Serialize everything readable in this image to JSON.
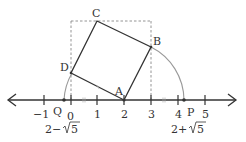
{
  "diagram": {
    "type": "number-line-with-square",
    "points": {
      "A": {
        "label": "A",
        "coord": [
          2,
          0
        ]
      },
      "B": {
        "label": "B",
        "coord": [
          3,
          2
        ]
      },
      "C": {
        "label": "C",
        "coord": [
          1,
          3
        ]
      },
      "D": {
        "label": "D",
        "coord": [
          0,
          1
        ]
      },
      "P": {
        "label": "P",
        "value_label": "2+√5"
      },
      "Q": {
        "label": "Q",
        "value_label": "2−√5"
      }
    },
    "number_line": {
      "ticks": [
        {
          "value": -1,
          "label": "−1"
        },
        {
          "value": 0,
          "label": "0"
        },
        {
          "value": 1,
          "label": "1"
        },
        {
          "value": 2,
          "label": "2"
        },
        {
          "value": 3,
          "label": "3"
        },
        {
          "value": 4,
          "label": "4"
        },
        {
          "value": 5,
          "label": "5"
        }
      ]
    },
    "labels": {
      "p_value_prefix": "2+",
      "q_value_prefix": "2−",
      "radicand": "5"
    },
    "colors": {
      "line": "#333333",
      "arc": "#888888",
      "dashed": "#888888"
    }
  }
}
